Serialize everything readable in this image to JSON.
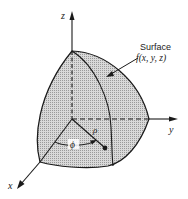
{
  "figure": {
    "type": "3d-surface-diagram",
    "colors": {
      "background": "#ffffff",
      "surface_fill": "#c8c8c8",
      "line": "#1a1a1a"
    },
    "axes": {
      "x": {
        "label": "x"
      },
      "y": {
        "label": "y"
      },
      "z": {
        "label": "z"
      }
    },
    "annotation": {
      "title": "Surface",
      "function": "f(x, y, z)"
    },
    "symbols": {
      "radius": "ρ",
      "azimuth": "ϕ"
    }
  }
}
